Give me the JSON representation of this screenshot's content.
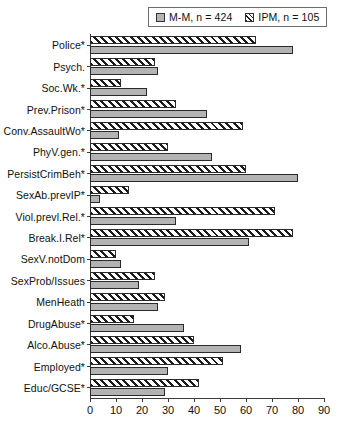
{
  "legend": {
    "position": "top-right",
    "items": [
      {
        "label": "M-M, n = 424",
        "swatch": "solid-gray-square",
        "color": "#b3b3b3"
      },
      {
        "label": "IPM, n = 105",
        "swatch": "hatched-square",
        "color": "#1c1c1c"
      }
    ]
  },
  "chart_data": {
    "type": "bar",
    "orientation": "horizontal",
    "title": "",
    "xlabel": "",
    "ylabel": "",
    "xlim": [
      0,
      90
    ],
    "xticks": [
      0,
      10,
      20,
      30,
      40,
      50,
      60,
      70,
      80,
      90
    ],
    "grid": false,
    "categories": [
      "Police*",
      "Psych.",
      "Soc.Wk.*",
      "Prev.Prison*",
      "Conv.AssaultWo*",
      "PhyV.gen.*",
      "PersistCrimBeh*",
      "SexAb.prevIP*",
      "Viol.prevl.Rel.*",
      "Break.I.Rel*",
      "SexV.notDom",
      "SexProb/Issues",
      "MenHeath",
      "DrugAbuse*",
      "Alco.Abuse*",
      "Employed*",
      "Educ/GCSE*"
    ],
    "series": [
      {
        "name": "IPM, n = 105",
        "style": "hatched",
        "values": [
          64,
          25,
          12,
          33,
          59,
          30,
          60,
          15,
          71,
          78,
          10,
          25,
          29,
          17,
          40,
          51,
          42
        ]
      },
      {
        "name": "M-M, n = 424",
        "style": "solid",
        "values": [
          78,
          26,
          22,
          45,
          11,
          47,
          80,
          4,
          33,
          61,
          12,
          19,
          26,
          36,
          58,
          30,
          29
        ]
      }
    ]
  }
}
